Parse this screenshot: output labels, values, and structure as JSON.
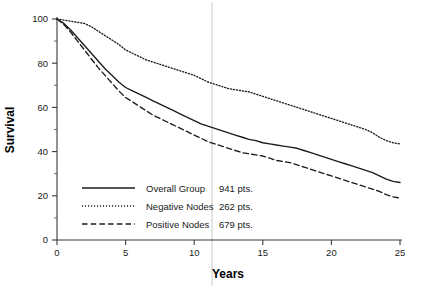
{
  "chart_data": {
    "type": "line",
    "title": "",
    "xlabel": "Years",
    "ylabel": "Survival",
    "xlim": [
      0,
      25
    ],
    "ylim": [
      0,
      100
    ],
    "xticks": [
      0,
      5,
      10,
      15,
      20,
      25
    ],
    "xtick_labels": [
      "0",
      "5",
      "10",
      "15",
      "20",
      "25"
    ],
    "yticks": [
      0,
      20,
      40,
      60,
      80,
      100
    ],
    "ytick_labels": [
      "0",
      "20",
      "40",
      "60",
      "80",
      "100"
    ],
    "yticks_minor": [
      10,
      30,
      50,
      70,
      90
    ],
    "grid": false,
    "legend_position": "lower-left-inside",
    "annotations": [
      {
        "name": "vertical-reference-line",
        "type": "vline",
        "x": 11.3,
        "color": "#c8c8c8"
      }
    ],
    "series": [
      {
        "name": "Overall Group",
        "label": "Overall Group",
        "count_label": "941 pts.",
        "count": 941,
        "style": "solid",
        "color": "#1c1c1c",
        "x": [
          0,
          0.5,
          1,
          1.5,
          2,
          2.5,
          3,
          3.5,
          4,
          4.5,
          5,
          5.5,
          6,
          6.5,
          7,
          7.5,
          8,
          8.5,
          9,
          9.5,
          10,
          10.5,
          11,
          11.5,
          12,
          12.5,
          13,
          13.5,
          14,
          14.5,
          15,
          15.5,
          16,
          16.5,
          17,
          17.5,
          18,
          18.5,
          19,
          19.5,
          20,
          20.5,
          21,
          21.5,
          22,
          22.5,
          23,
          23.5,
          24,
          24.5,
          25
        ],
        "y": [
          100,
          98,
          95,
          91.5,
          88,
          84.5,
          81,
          77.5,
          74.5,
          71.5,
          69,
          67.5,
          66,
          64.5,
          63,
          61.5,
          60,
          58.5,
          57,
          55.5,
          54,
          52.5,
          51.5,
          50.5,
          49.5,
          48.5,
          47.5,
          46.5,
          45.5,
          45,
          44,
          43.5,
          43,
          42.5,
          42,
          41.5,
          40.5,
          39.5,
          38.5,
          37.5,
          36.5,
          35.5,
          34.5,
          33.5,
          32.5,
          31.5,
          30.5,
          29,
          27.5,
          26.5,
          26
        ]
      },
      {
        "name": "Negative Nodes",
        "label": "Negative Nodes",
        "count_label": "262 pts.",
        "count": 262,
        "style": "dotted",
        "color": "#1c1c1c",
        "x": [
          0,
          0.5,
          1,
          1.5,
          2,
          2.5,
          3,
          3.5,
          4,
          4.5,
          5,
          5.5,
          6,
          6.5,
          7,
          7.5,
          8,
          8.5,
          9,
          9.5,
          10,
          10.5,
          11,
          11.5,
          12,
          12.5,
          13,
          13.5,
          14,
          14.5,
          15,
          15.5,
          16,
          16.5,
          17,
          17.5,
          18,
          18.5,
          19,
          19.5,
          20,
          20.5,
          21,
          21.5,
          22,
          22.5,
          23,
          23.5,
          24,
          24.5,
          25
        ],
        "y": [
          100,
          99.5,
          99,
          98.5,
          98,
          96.5,
          94.5,
          92.5,
          90.5,
          88.5,
          86,
          84.5,
          83,
          81.5,
          80.5,
          79.5,
          78.5,
          77.5,
          76.5,
          75.5,
          74.5,
          73,
          71.5,
          70.5,
          69.5,
          68.5,
          68,
          67.5,
          67,
          66,
          65,
          64,
          63,
          62,
          61,
          60,
          59,
          58,
          57,
          56,
          55,
          54,
          53,
          52,
          51,
          50,
          48.5,
          46.5,
          45,
          44,
          43.5
        ]
      },
      {
        "name": "Positive Nodes",
        "label": "Positive Nodes",
        "count_label": "679 pts.",
        "count": 679,
        "style": "dashed",
        "color": "#1c1c1c",
        "x": [
          0,
          0.5,
          1,
          1.5,
          2,
          2.5,
          3,
          3.5,
          4,
          4.5,
          5,
          5.5,
          6,
          6.5,
          7,
          7.5,
          8,
          8.5,
          9,
          9.5,
          10,
          10.5,
          11,
          11.5,
          12,
          12.5,
          13,
          13.5,
          14,
          14.5,
          15,
          15.5,
          16,
          16.5,
          17,
          17.5,
          18,
          18.5,
          19,
          19.5,
          20,
          20.5,
          21,
          21.5,
          22,
          22.5,
          23,
          23.5,
          24,
          24.5,
          25
        ],
        "y": [
          100,
          97.5,
          94,
          90,
          86,
          82,
          78,
          74.5,
          71,
          67.5,
          64.5,
          62.5,
          60.5,
          58.5,
          56.5,
          55,
          53.5,
          52,
          50.5,
          49,
          47.5,
          46,
          44.5,
          43.5,
          42.5,
          41.5,
          40.5,
          39.5,
          39,
          38.5,
          38,
          37,
          36,
          35.5,
          35,
          34,
          33,
          32,
          31,
          30,
          29,
          28,
          27,
          26,
          25,
          24,
          23,
          22,
          20.5,
          19.5,
          19
        ]
      }
    ]
  }
}
